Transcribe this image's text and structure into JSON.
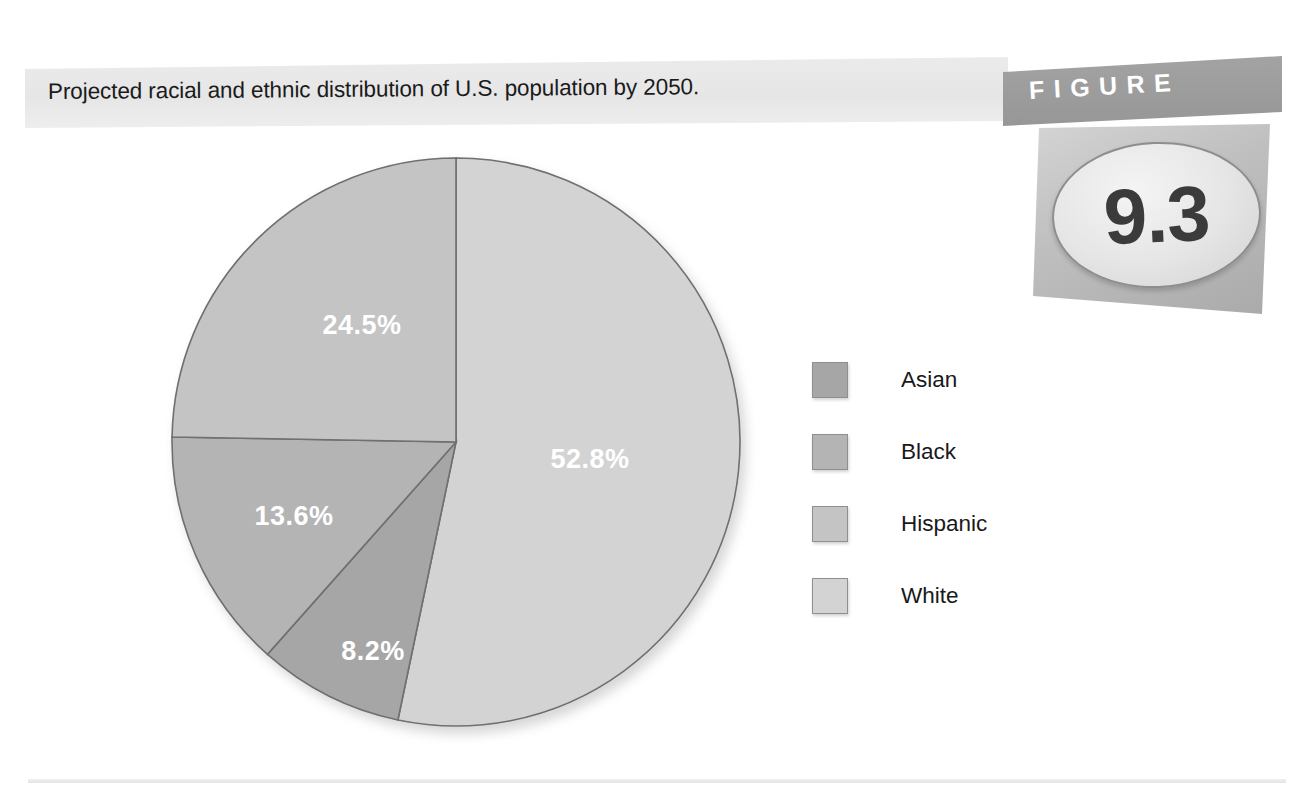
{
  "caption": {
    "text": "Projected racial and ethnic distribution of U.S. population by 2050."
  },
  "figure_badge": {
    "banner_label": "FIGURE",
    "number": "9.3"
  },
  "legend": {
    "items": [
      {
        "label": "Asian",
        "color": "#a6a6a6"
      },
      {
        "label": "Black",
        "color": "#b4b4b4"
      },
      {
        "label": "Hispanic",
        "color": "#c4c4c4"
      },
      {
        "label": "White",
        "color": "#d3d3d3"
      }
    ]
  },
  "chart_data": {
    "type": "pie",
    "title": "Projected racial and ethnic distribution of U.S. population by 2050.",
    "categories": [
      "White",
      "Asian",
      "Black",
      "Hispanic"
    ],
    "values": [
      52.8,
      8.2,
      13.6,
      24.5
    ],
    "labels": [
      "52.8%",
      "8.2%",
      "13.6%",
      "24.5%"
    ],
    "colors": [
      "#d3d3d3",
      "#a6a6a6",
      "#b4b4b4",
      "#c4c4c4"
    ],
    "units": "percent",
    "start_angle_deg": 0,
    "direction": "clockwise",
    "legend_position": "right",
    "grid": false,
    "slices": [
      {
        "name": "White",
        "value": 52.8,
        "label": "52.8%",
        "color": "#d3d3d3",
        "label_x": 590,
        "label_y": 468
      },
      {
        "name": "Asian",
        "value": 8.2,
        "label": "8.2%",
        "color": "#a6a6a6",
        "label_x": 373,
        "label_y": 660
      },
      {
        "name": "Black",
        "value": 13.6,
        "label": "13.6%",
        "color": "#b4b4b4",
        "label_x": 294,
        "label_y": 525
      },
      {
        "name": "Hispanic",
        "value": 24.5,
        "label": "24.5%",
        "color": "#c4c4c4",
        "label_x": 362,
        "label_y": 334
      }
    ],
    "geometry": {
      "cx": 456,
      "cy": 442,
      "r": 284
    }
  }
}
